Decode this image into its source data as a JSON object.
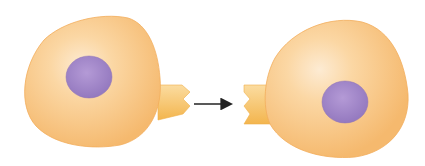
{
  "diagram": {
    "colors": {
      "cell_fill": "#f9c987",
      "cell_edge": "#f2ad5c",
      "cell_highlight": "#fde8cc",
      "nucleus": "#a68bc9",
      "nucleus_edge": "#8e72b6",
      "connector": "#f8c870",
      "connector_shadow": "#f0b04a",
      "arrow": "#222222",
      "background": "#ffffff"
    },
    "nodes": [
      {
        "id": "left-cell",
        "label": ""
      },
      {
        "id": "right-cell",
        "label": ""
      }
    ],
    "edges": [
      {
        "from": "left-cell",
        "to": "right-cell",
        "label": ""
      }
    ]
  }
}
